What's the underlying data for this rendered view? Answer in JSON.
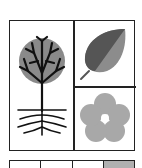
{
  "figure": {
    "panels": [
      {
        "id": "tree",
        "icon": "tree-with-roots-icon",
        "position": "left-tall"
      },
      {
        "id": "leaf",
        "icon": "leaf-icon",
        "position": "top-right"
      },
      {
        "id": "flower",
        "icon": "flower-icon",
        "position": "bottom-right"
      }
    ],
    "bottom_row": {
      "cells": [
        {
          "fill": "#ffffff"
        },
        {
          "fill": "#ffffff"
        },
        {
          "fill": "#ffffff"
        },
        {
          "fill": "#b0b0b0"
        }
      ]
    },
    "colors": {
      "line": "#222222",
      "tree_canopy": "#8a8a8a",
      "leaf_dark": "#555555",
      "leaf_light": "#8c8c8c",
      "flower": "#a8a8a8"
    }
  }
}
